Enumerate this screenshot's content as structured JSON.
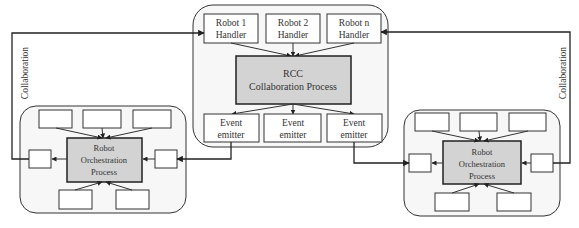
{
  "colors": {
    "stroke": "#222222",
    "container_fill": "#f7f7f7",
    "process_fill": "#d3d3d3",
    "box_fill": "#ffffff",
    "text": "#333333"
  },
  "center": {
    "handlers": [
      {
        "line1": "Robot 1",
        "line2": "Handler"
      },
      {
        "line1": "Robot  2",
        "line2": "Handler"
      },
      {
        "line1": "Robot  n",
        "line2": "Handler"
      }
    ],
    "process": {
      "line1": "RCC",
      "line2": "Collaboration Process"
    },
    "emitters": [
      {
        "line1": "Event",
        "line2": "emitter"
      },
      {
        "line1": "Event",
        "line2": "emitter"
      },
      {
        "line1": "Event",
        "line2": "emitter"
      }
    ]
  },
  "left": {
    "process": {
      "line1": "Robot",
      "line2": "Orchestration",
      "line3": "Process"
    },
    "collab_label": "Collaboration"
  },
  "right": {
    "process": {
      "line1": "Robot",
      "line2": "Orchestration",
      "line3": "Process"
    },
    "collab_label": "Collaboration"
  }
}
